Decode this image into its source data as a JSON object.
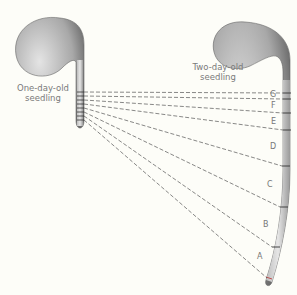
{
  "labels": {
    "one_day": [
      "One-day-old",
      "seedling"
    ],
    "two_day": [
      "Two-day-old",
      "seedling"
    ]
  },
  "segments": [
    "G",
    "F",
    "E",
    "D",
    "C",
    "B",
    "A"
  ],
  "colors": {
    "line": "#555555",
    "stem": "#cfcfcf",
    "accent": "#c05050",
    "text": "#7a7a7a"
  }
}
